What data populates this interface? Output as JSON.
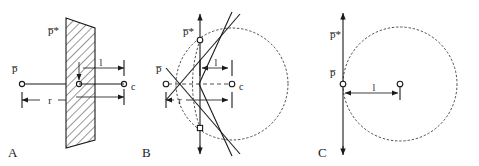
{
  "figure": {
    "type": "geometric-diagram",
    "background": "#ffffff",
    "ink_color": "#1a1a1a",
    "width": 479,
    "height": 166
  },
  "panels": [
    {
      "id": "A",
      "letter": "A",
      "description": "point source with hatched plane seen edge-on",
      "labels": {
        "source": "p̅",
        "image": "p̅*",
        "center": "c",
        "dim_small": "l",
        "dim_large": "r"
      }
    },
    {
      "id": "B",
      "letter": "B",
      "description": "cone tangent to dotted circle with vertical axis",
      "labels": {
        "source": "p̅",
        "image": "p̅*",
        "center": "c",
        "dim_small": "l",
        "dim_large": "r"
      }
    },
    {
      "id": "C",
      "letter": "C",
      "description": "vertical axis tangent to dotted circle",
      "labels": {
        "source": "p̅",
        "image": "p̅*",
        "dim_small": "l"
      }
    }
  ],
  "glyphs": {
    "p_bar": "p̅",
    "p_bar_star": "p̅*",
    "c": "c",
    "l": "l",
    "r": "r"
  }
}
